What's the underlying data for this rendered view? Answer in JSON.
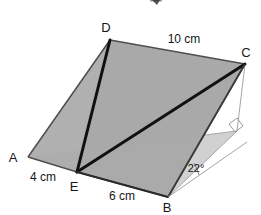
{
  "figure": {
    "colors": {
      "background": "#ffffff",
      "face_fill": "#a9a9a9",
      "face_fill_light": "#b4b4b4",
      "face_fill_dark": "#9d9d9d",
      "outline": "#4a4a4a",
      "bold_edge": "#111111",
      "hidden_edge": "#9a9a9a",
      "label_color": "#161616"
    },
    "vertices": [
      {
        "id": "A",
        "label": "A",
        "x": 28,
        "y": 157,
        "label_x": 14,
        "label_y": 162
      },
      {
        "id": "B",
        "label": "B",
        "x": 168,
        "y": 197,
        "label_x": 166,
        "label_y": 212
      },
      {
        "id": "C",
        "label": "C",
        "x": 245,
        "y": 64,
        "label_x": 243,
        "label_y": 57
      },
      {
        "id": "D",
        "label": "D",
        "x": 110,
        "y": 40,
        "label_x": 105,
        "label_y": 32
      },
      {
        "id": "E",
        "label": "E",
        "x": 77,
        "y": 172,
        "label_x": 72,
        "label_y": 190
      },
      {
        "id": "F",
        "label": "",
        "x": 237,
        "y": 131,
        "label_x": 0,
        "label_y": 0
      }
    ],
    "edge_labels": [
      {
        "id": "edge-dc",
        "text": "10 cm",
        "x": 184,
        "y": 42
      },
      {
        "id": "edge-ae",
        "text": "4 cm",
        "x": 42,
        "y": 180
      },
      {
        "id": "edge-eb",
        "text": "6 cm",
        "x": 122,
        "y": 199
      },
      {
        "id": "angle-b",
        "text": "22°",
        "x": 196,
        "y": 172
      }
    ],
    "markers": {
      "right_angle": {
        "id": "right-angle-marker",
        "x": 237,
        "y": 131
      },
      "angle_arc": {
        "id": "angle-arc-b",
        "vertex": "B",
        "measure": "22°"
      }
    }
  }
}
